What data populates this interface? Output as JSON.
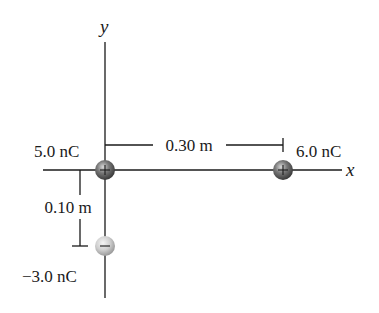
{
  "diagram": {
    "type": "point-charges-coordinate-system",
    "axes": {
      "x_label": "x",
      "y_label": "y"
    },
    "charges": [
      {
        "id": "q1",
        "label": "5.0 nC",
        "sign": "+",
        "position_m": [
          0,
          0
        ],
        "color": "#6a6a6a"
      },
      {
        "id": "q2",
        "label": "6.0 nC",
        "sign": "+",
        "position_m": [
          0.3,
          0
        ],
        "color": "#6a6a6a"
      },
      {
        "id": "q3",
        "label": "−3.0 nC",
        "sign": "−",
        "position_m": [
          0,
          -0.1
        ],
        "color": "#c8c8c8"
      }
    ],
    "dimensions": [
      {
        "id": "horizontal",
        "label": "0.30 m",
        "between": [
          "q1",
          "q2"
        ]
      },
      {
        "id": "vertical",
        "label": "0.10 m",
        "between": [
          "q1",
          "q3"
        ]
      }
    ]
  }
}
